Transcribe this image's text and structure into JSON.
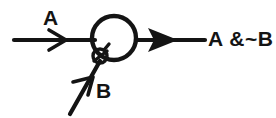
{
  "diagram": {
    "type": "neuron-logic-gate",
    "background_color": "#ffffff",
    "ink_color": "#141414",
    "inputs": [
      {
        "id": "a",
        "label": "A",
        "kind": "excitatory",
        "arrowhead": "open-v",
        "orientation": "horizontal"
      },
      {
        "id": "b",
        "label": "B",
        "kind": "inhibitory",
        "arrowhead": "open-v",
        "orientation": "diagonal",
        "terminal": "crossed-circle"
      }
    ],
    "body": {
      "shape": "circle",
      "name": "cell-body"
    },
    "output": {
      "label": "A &~B",
      "arrowhead": "solid",
      "orientation": "horizontal"
    }
  }
}
